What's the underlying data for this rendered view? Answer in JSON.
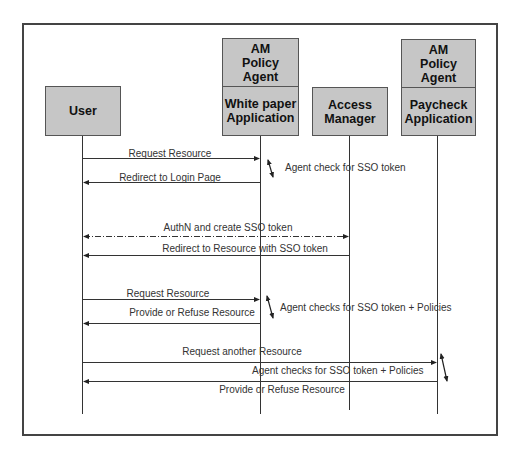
{
  "participants": [
    {
      "id": "user",
      "label": "User",
      "x": 82
    },
    {
      "id": "whitepaper",
      "agent_label": "AM\nPolicy\nAgent",
      "label": "White paper\nApplication",
      "x": 260
    },
    {
      "id": "am",
      "label": "Access\nManager",
      "x": 349
    },
    {
      "id": "paycheck",
      "agent_label": "AM\nPolicy\nAgent",
      "label": "Paycheck\nApplication",
      "x": 437
    }
  ],
  "messages": [
    {
      "label": "Request Resource",
      "from": "user",
      "to": "whitepaper",
      "y": 158,
      "style": "solid"
    },
    {
      "label": "Redirect to Login Page",
      "from": "whitepaper",
      "to": "user",
      "y": 182,
      "style": "solid"
    },
    {
      "label": "AuthN and create SSO token",
      "from": "user",
      "to": "am",
      "y": 236,
      "style": "dashdot",
      "bidirectional": true
    },
    {
      "label": "Redirect to Resource with SSO token",
      "from": "am",
      "to": "user",
      "y": 255,
      "style": "solid"
    },
    {
      "label": "Request Resource",
      "from": "user",
      "to": "whitepaper",
      "y": 299,
      "style": "solid"
    },
    {
      "label": "Provide or Refuse Resource",
      "from": "whitepaper",
      "to": "user",
      "y": 323,
      "style": "solid"
    },
    {
      "label": "Request another Resource",
      "from": "user",
      "to": "paycheck",
      "y": 362,
      "style": "solid"
    },
    {
      "label": "Provide or Refuse Resource",
      "from": "paycheck",
      "to": "user",
      "y": 381,
      "style": "solid"
    }
  ],
  "notes": [
    {
      "label": "Agent check for SSO token"
    },
    {
      "label": "Agent checks for SSO token + Policies"
    },
    {
      "label": "Agent checks for SSO token + Policies"
    }
  ]
}
